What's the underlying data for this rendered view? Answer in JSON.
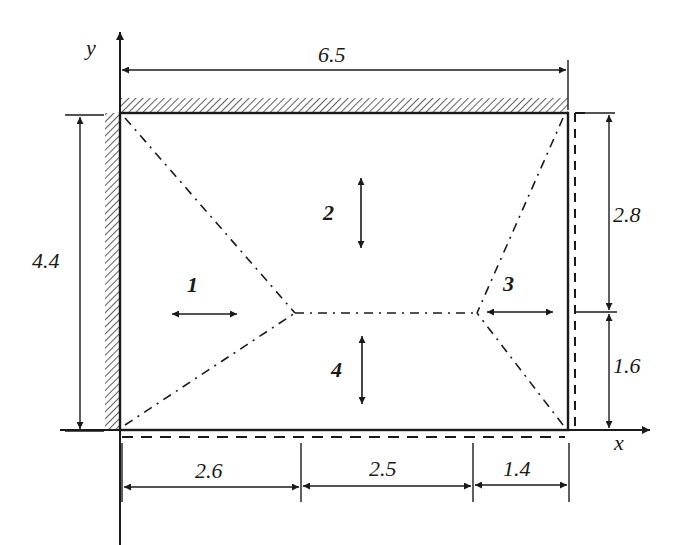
{
  "diagram": {
    "type": "plate-yield-line-diagram",
    "axes": {
      "x_label": "x",
      "y_label": "y"
    },
    "dimensions": {
      "top_width": "6.5",
      "left_height": "4.4",
      "right_upper": "2.8",
      "right_lower": "1.6",
      "bottom_left": "2.6",
      "bottom_middle": "2.5",
      "bottom_right": "1.4"
    },
    "zones": [
      {
        "id": "1",
        "label": "1",
        "motion": "horizontal"
      },
      {
        "id": "2",
        "label": "2",
        "motion": "vertical"
      },
      {
        "id": "3",
        "label": "3",
        "motion": "horizontal"
      },
      {
        "id": "4",
        "label": "4",
        "motion": "vertical"
      }
    ],
    "edges": {
      "top": "fixed (hatched)",
      "left": "fixed (hatched)",
      "right": "simply supported (dashed)",
      "bottom": "simply supported (dashed)"
    },
    "colors": {
      "ink": "#1a1a1a",
      "background": "#ffffff"
    }
  }
}
